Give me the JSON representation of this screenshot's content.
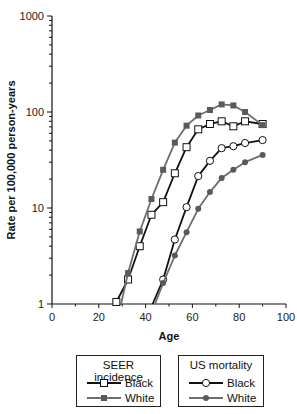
{
  "chart_data": {
    "type": "line",
    "title": "",
    "xlabel": "Age",
    "ylabel": "Rate per 100,000 person-years",
    "xlim": [
      0,
      100
    ],
    "ylim": [
      1,
      1000
    ],
    "yscale": "log",
    "xticks": [
      0,
      20,
      40,
      60,
      80,
      100
    ],
    "yticks": [
      1,
      10,
      100,
      1000
    ],
    "grid": false,
    "legend_position": "below",
    "legend_groups": [
      {
        "title": "SEER incidence",
        "entries": [
          "Black",
          "White"
        ]
      },
      {
        "title": "US mortality",
        "entries": [
          "Black",
          "White"
        ]
      }
    ],
    "series": [
      {
        "name": "SEER incidence Black",
        "group": "SEER incidence",
        "marker": "open-square",
        "color": "#111111",
        "x": [
          27.5,
          32.5,
          37.5,
          42.5,
          47.5,
          52.5,
          57.5,
          62.5,
          67.5,
          72.5,
          77.5,
          82.5,
          90
        ],
        "values": [
          1.05,
          1.8,
          4.0,
          8.5,
          11.5,
          23,
          43,
          66,
          75,
          80,
          71,
          80,
          75
        ]
      },
      {
        "name": "SEER incidence White",
        "group": "SEER incidence",
        "marker": "filled-square",
        "color": "#6e6e6e",
        "x": [
          29.5,
          32.5,
          37.5,
          42.5,
          47.5,
          52.5,
          57.5,
          62.5,
          67.5,
          72.5,
          77.5,
          82.5,
          90
        ],
        "values": [
          1.0,
          2.1,
          5.7,
          12.4,
          25,
          48,
          72,
          92,
          105,
          120,
          117,
          100,
          73
        ]
      },
      {
        "name": "US mortality Black",
        "group": "US mortality",
        "marker": "open-circle",
        "color": "#111111",
        "x": [
          43,
          47.5,
          52.5,
          57.5,
          62.5,
          67.5,
          72.5,
          77.5,
          82.5,
          90
        ],
        "values": [
          1.0,
          1.8,
          4.7,
          10.2,
          21.5,
          31,
          42,
          44,
          47.5,
          51
        ]
      },
      {
        "name": "US mortality White",
        "group": "US mortality",
        "marker": "filled-circle",
        "color": "#6e6e6e",
        "x": [
          44,
          47.5,
          52.5,
          57.5,
          62.5,
          67.5,
          72.5,
          77.5,
          82.5,
          90
        ],
        "values": [
          1.0,
          1.65,
          3.2,
          5.6,
          9.8,
          14.7,
          20.5,
          25,
          30,
          35.7
        ]
      }
    ]
  },
  "axes": {
    "x_title": "Age",
    "y_title": "Rate per 100,000 person-years",
    "x_tick_labels": [
      "0",
      "20",
      "40",
      "60",
      "80",
      "100"
    ],
    "y_tick_labels": [
      "1",
      "10",
      "100",
      "1000"
    ]
  },
  "legend": {
    "seer": {
      "title": "SEER incidence",
      "black": "Black",
      "white": "White"
    },
    "us": {
      "title": "US mortality",
      "black": "Black",
      "white": "White"
    }
  }
}
